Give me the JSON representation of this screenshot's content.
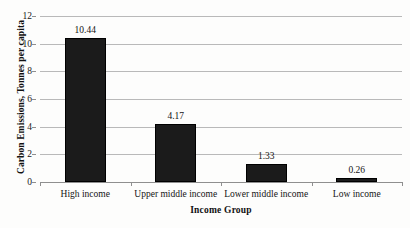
{
  "chart_data": {
    "type": "bar",
    "title": "",
    "xlabel": "Income Group",
    "ylabel": "Carbon Emissions, Tonnes per capita",
    "categories": [
      "High income",
      "Upper middle income",
      "Lower middle income",
      "Low income"
    ],
    "values": [
      10.44,
      4.17,
      1.33,
      0.26
    ],
    "value_labels": [
      "10.44",
      "4.17",
      "1.33",
      "0.26"
    ],
    "ylim": [
      0,
      12
    ],
    "yticks": [
      0,
      2,
      4,
      6,
      8,
      10,
      12
    ],
    "ytick_labels": [
      "0",
      "2",
      "4",
      "6",
      "8",
      "10",
      "12"
    ],
    "grid": "horizontal",
    "legend": "none",
    "bar_color": "#1b1b1b",
    "grid_color": "#b9b9b9",
    "axis_color": "#8f8f8f",
    "background": "#fdfdfc"
  }
}
